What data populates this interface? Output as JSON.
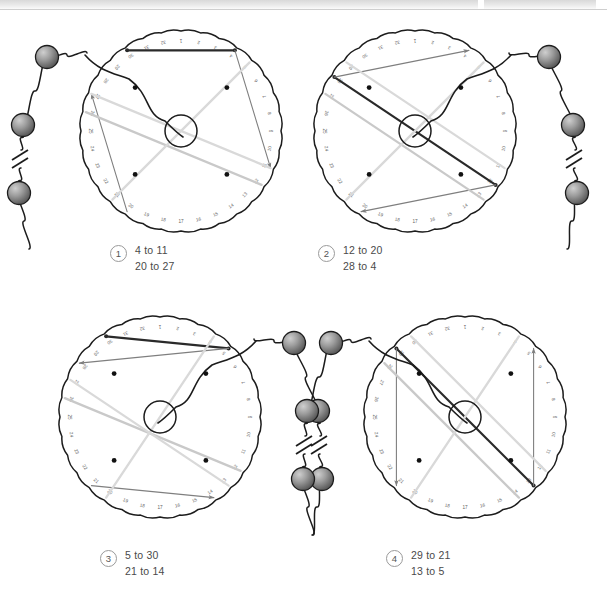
{
  "figure": {
    "dial": {
      "tick_count": 32,
      "tick_labels": [
        "1",
        "2",
        "3",
        "4",
        "5",
        "6",
        "7",
        "8",
        "9",
        "10",
        "11",
        "12",
        "13",
        "14",
        "15",
        "16",
        "17",
        "18",
        "19",
        "20",
        "21",
        "22",
        "23",
        "24",
        "25",
        "26",
        "27",
        "28",
        "29",
        "30",
        "31",
        "32"
      ],
      "interior_dot_count": 4,
      "hub_label": "center-hub"
    },
    "colors": {
      "outline": "#1c1c1c",
      "dark_chord": "#2a2a2a",
      "mid_chord": "#7f7f7f",
      "light_chord": "#c9c9c9",
      "pale_chord": "#d9d9d9",
      "bead_dark": "#4a4a4a",
      "bead_light": "#b6b6b6",
      "caption_text": "#4a4a4a",
      "badge_border": "#9a9a9a",
      "scan_strip": "#d9d9d9"
    },
    "panels": [
      {
        "number": "1",
        "lines": [
          "4 to 11",
          "20 to 27"
        ],
        "chain_side": "left",
        "bead_count": 3,
        "chords": [
          {
            "name": "dark-chord",
            "from": 4,
            "to": 30,
            "tone": "dark"
          },
          {
            "name": "arrow-chord-4-11",
            "from": 4,
            "to": 11,
            "tone": "mid",
            "arrow": "to"
          },
          {
            "name": "arrow-chord-20-27",
            "from": 20,
            "to": 27,
            "tone": "mid",
            "arrow": "to"
          },
          {
            "name": "pale-chord-a",
            "from": 26,
            "to": 12,
            "tone": "light"
          },
          {
            "name": "pale-chord-b",
            "from": 27,
            "to": 11,
            "tone": "pale"
          },
          {
            "name": "pale-chord-c",
            "from": 5,
            "to": 21,
            "tone": "pale"
          }
        ]
      },
      {
        "number": "2",
        "lines": [
          "12 to 20",
          "28 to 4"
        ],
        "chain_side": "right",
        "bead_count": 3,
        "chords": [
          {
            "name": "dark-chord",
            "from": 28,
            "to": 12,
            "tone": "dark"
          },
          {
            "name": "arrow-chord-28-4",
            "from": 28,
            "to": 4,
            "tone": "mid",
            "arrow": "to"
          },
          {
            "name": "arrow-chord-12-20",
            "from": 12,
            "to": 20,
            "tone": "mid",
            "arrow": "to"
          },
          {
            "name": "pale-chord-a",
            "from": 27,
            "to": 13,
            "tone": "light"
          },
          {
            "name": "pale-chord-b",
            "from": 5,
            "to": 21,
            "tone": "pale"
          },
          {
            "name": "pale-chord-c",
            "from": 11,
            "to": 29,
            "tone": "pale"
          }
        ]
      },
      {
        "number": "3",
        "lines": [
          "5 to 30",
          "21 to 14"
        ],
        "chain_side": "right",
        "bead_count": 3,
        "chords": [
          {
            "name": "dark-chord",
            "from": 5,
            "to": 30,
            "tone": "dark"
          },
          {
            "name": "arrow-chord-5-28",
            "from": 5,
            "to": 28,
            "tone": "mid",
            "arrow": "to"
          },
          {
            "name": "arrow-chord-21-14",
            "from": 21,
            "to": 14,
            "tone": "mid",
            "arrow": "to"
          },
          {
            "name": "pale-chord-a",
            "from": 26,
            "to": 12,
            "tone": "light"
          },
          {
            "name": "pale-chord-b",
            "from": 27,
            "to": 13,
            "tone": "pale"
          },
          {
            "name": "pale-chord-c",
            "from": 4,
            "to": 20,
            "tone": "pale"
          }
        ]
      },
      {
        "number": "4",
        "lines": [
          "29 to 21",
          "13 to 5"
        ],
        "chain_side": "left",
        "bead_count": 3,
        "chords": [
          {
            "name": "dark-chord",
            "from": 29,
            "to": 13,
            "tone": "dark"
          },
          {
            "name": "arrow-chord-13-5",
            "from": 13,
            "to": 5,
            "tone": "mid",
            "arrow": "to"
          },
          {
            "name": "arrow-chord-29-21",
            "from": 29,
            "to": 21,
            "tone": "mid",
            "arrow": "to"
          },
          {
            "name": "pale-chord-a",
            "from": 28,
            "to": 14,
            "tone": "light"
          },
          {
            "name": "pale-chord-b",
            "from": 4,
            "to": 20,
            "tone": "pale"
          },
          {
            "name": "pale-chord-c",
            "from": 12,
            "to": 30,
            "tone": "pale"
          }
        ]
      }
    ]
  }
}
